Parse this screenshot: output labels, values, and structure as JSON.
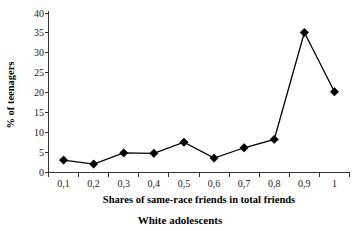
{
  "chart_data": {
    "type": "line",
    "title": "",
    "caption": "White adolescents",
    "xlabel": "Shares of same-race friends in total friends",
    "ylabel": "% of teenagers",
    "categories": [
      "0,1",
      "0,2",
      "0,3",
      "0,4",
      "0,5",
      "0,6",
      "0,7",
      "0,8",
      "0,9",
      "1"
    ],
    "values": [
      3.0,
      2.0,
      4.8,
      4.7,
      7.5,
      3.5,
      6.1,
      8.2,
      35.1,
      20.2
    ],
    "ytick_labels": [
      "0",
      "5",
      "10",
      "15",
      "20",
      "25",
      "30",
      "35",
      "40"
    ],
    "ytick_values": [
      0,
      5,
      10,
      15,
      20,
      25,
      30,
      35,
      40
    ],
    "ylim": [
      0,
      40
    ],
    "grid": false,
    "legend": "none",
    "marker": "diamond",
    "line_color": "#000000",
    "marker_color": "#000000",
    "axis_color": "#333333",
    "background_color": "#ffffff"
  },
  "axis": {
    "x_title": "Shares of same-race friends in total friends",
    "y_title": "% of teenagers"
  },
  "figure": {
    "caption": "White adolescents"
  }
}
